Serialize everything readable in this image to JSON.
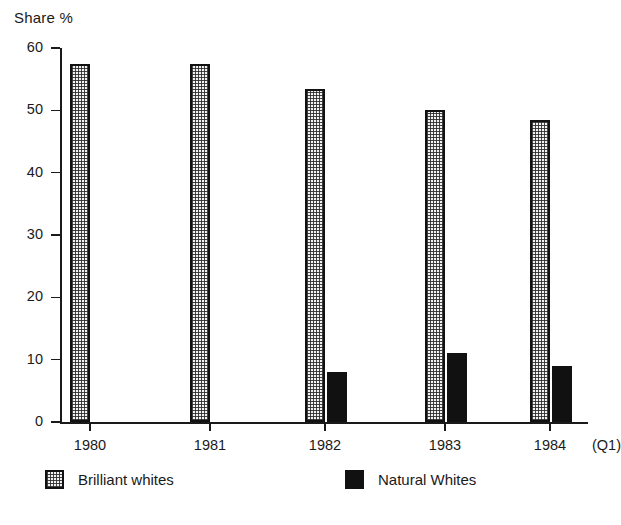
{
  "chart_data": {
    "type": "bar",
    "title": "",
    "ylabel": "Share %",
    "xlabel": "",
    "ylim": [
      0,
      60
    ],
    "yticks": [
      0,
      10,
      20,
      30,
      40,
      50,
      60
    ],
    "ytick_labels": [
      "0",
      "10",
      "20",
      "30",
      "40",
      "50",
      "60"
    ],
    "categories": [
      "1980",
      "1981",
      "1982",
      "1983",
      "1984"
    ],
    "category_note": "(Q1)",
    "grid": false,
    "legend_position": "bottom",
    "series": [
      {
        "name": "Brilliant whites",
        "fill": "dotted-light",
        "color": "#f2f2f2",
        "values": [
          57.5,
          57.5,
          53.5,
          50.0,
          48.5
        ]
      },
      {
        "name": "Natural Whites",
        "fill": "solid-black",
        "color": "#111111",
        "values": [
          null,
          null,
          8.0,
          11.0,
          9.0
        ]
      }
    ]
  },
  "axis": {
    "y_title": "Share %"
  },
  "legend": {
    "items": [
      {
        "label": "Brilliant whites",
        "swatch": "brilliant"
      },
      {
        "label": "Natural Whites",
        "swatch": "natural"
      }
    ]
  },
  "colors": {
    "ink": "#1a1a1a",
    "bar_dark": "#111111",
    "bar_light": "#f2f2f2",
    "background": "#ffffff"
  }
}
